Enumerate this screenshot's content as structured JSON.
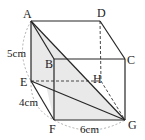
{
  "figure": {
    "type": "rectangular-prism",
    "vertices": {
      "A": {
        "label": "A",
        "x": 31,
        "y": 21
      },
      "D": {
        "label": "D",
        "x": 100,
        "y": 21
      },
      "B": {
        "label": "B",
        "x": 54,
        "y": 59
      },
      "C": {
        "label": "C",
        "x": 125,
        "y": 59
      },
      "E": {
        "label": "E",
        "x": 31,
        "y": 81
      },
      "H": {
        "label": "H",
        "x": 101,
        "y": 81
      },
      "F": {
        "label": "F",
        "x": 54,
        "y": 120
      },
      "G": {
        "label": "G",
        "x": 125,
        "y": 120
      }
    },
    "dimensions": {
      "AE": "5cm",
      "EF": "4cm",
      "FG": "6cm"
    },
    "shaded_triangles": [
      "A-E-G",
      "A-F-G"
    ],
    "diagonals": [
      "A-G",
      "A-F",
      "E-G"
    ],
    "hidden_edges": [
      "D-H",
      "E-H",
      "H-G"
    ],
    "colors": {
      "edge": "#2a2a2a",
      "hidden": "#444444",
      "shade": "#e8e8e8",
      "arc": "#999999"
    }
  }
}
